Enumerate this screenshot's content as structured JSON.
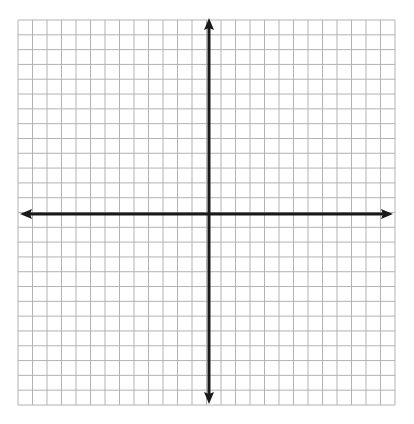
{
  "diagram": {
    "type": "coordinate-plane",
    "grid": {
      "left": 18,
      "top": 20,
      "right": 395,
      "bottom": 405,
      "columns": 26,
      "rows": 26,
      "line_color": "#b3b3b3",
      "background": "#ffffff"
    },
    "axes": {
      "color": "#1a1a1a",
      "origin_x": 209,
      "origin_y": 214,
      "x_axis": {
        "from": 20,
        "to": 393,
        "arrows": "both"
      },
      "y_axis": {
        "from": 18,
        "to": 404,
        "arrows": "both"
      }
    }
  }
}
